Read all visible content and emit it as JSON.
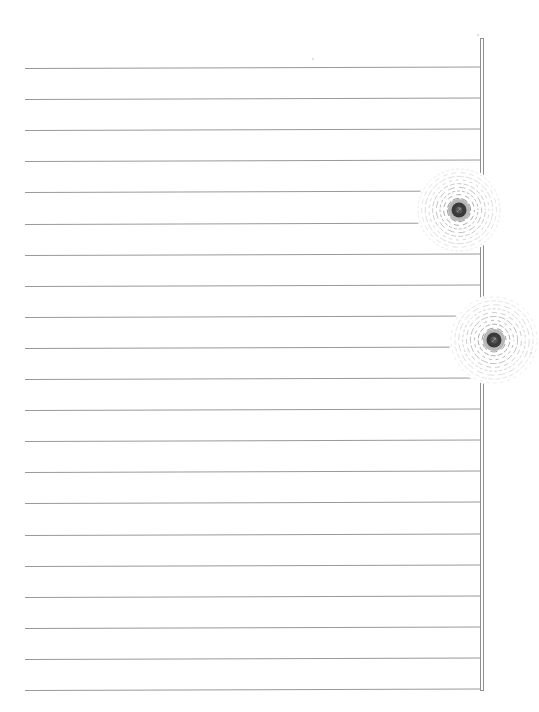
{
  "page": {
    "type": "lined-paper",
    "background_color": "#ffffff",
    "line_color": "#9a9a9a",
    "margin_bar_color": "#8f8f8f",
    "ring_color": "#8a8a8a",
    "ring_core_color": "#3a3a3a"
  },
  "rule_lines": {
    "count": 21,
    "left": 25,
    "right": 481,
    "first_y": 68,
    "spacing": 31.1,
    "tilt_px": -1.5
  },
  "margin_bar": {
    "x": 480,
    "top": 38,
    "bottom": 691,
    "width": 4
  },
  "ring_marks": [
    {
      "name": "ring-mark-upper",
      "cx": 459,
      "cy": 210,
      "r": 41,
      "rings": 9
    },
    {
      "name": "ring-mark-lower",
      "cx": 494,
      "cy": 340,
      "r": 43,
      "rings": 9
    }
  ],
  "specks": [
    {
      "x": 312,
      "y": 58
    },
    {
      "x": 477,
      "y": 34
    },
    {
      "x": 530,
      "y": 352
    }
  ]
}
